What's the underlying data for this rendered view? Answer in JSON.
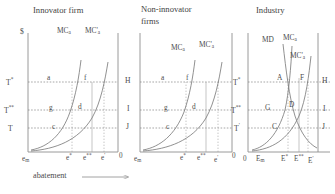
{
  "figure": {
    "axis_value_label": "$",
    "bottom_axis_label": "abatement",
    "panels": [
      {
        "id": "innovator",
        "title": "Innovator firm",
        "curves": [
          {
            "name": "MCa",
            "label_main": "MC",
            "label_sub": "a"
          },
          {
            "name": "MC'a",
            "label_main": "MC'",
            "label_sub": "a"
          }
        ],
        "y_labels": [
          {
            "main": "T",
            "sup": "*"
          },
          {
            "main": "T",
            "sup": "**"
          },
          {
            "main": "T",
            "sup": ""
          }
        ],
        "points": [
          "a",
          "f",
          "g",
          "d",
          "c"
        ],
        "x_labels": [
          {
            "main": "e",
            "sub": "m",
            "sup": ""
          },
          {
            "main": "e",
            "sub": "",
            "sup": "*"
          },
          {
            "main": "e",
            "sub": "",
            "sup": "**"
          },
          {
            "main": "e",
            "sub": "",
            "sup": "'"
          },
          {
            "main": "0",
            "sub": "",
            "sup": ""
          }
        ]
      },
      {
        "id": "non-innovator",
        "title": "Non-innovator firms",
        "title_line1": "Non-innovator",
        "title_line2": "firms",
        "curves": [
          {
            "name": "MCa",
            "label_main": "MC",
            "label_sub": "a"
          },
          {
            "name": "MC'a",
            "label_main": "MC'",
            "label_sub": "a"
          }
        ],
        "y_labels": [
          {
            "main": "H",
            "sup": ""
          },
          {
            "main": "I",
            "sup": ""
          },
          {
            "main": "J",
            "sup": ""
          }
        ],
        "points": [
          "a",
          "f",
          "g",
          "d",
          "c"
        ],
        "x_labels": [
          {
            "main": "e",
            "sub": "m",
            "sup": ""
          },
          {
            "main": "e",
            "sub": "",
            "sup": "*"
          },
          {
            "main": "e",
            "sub": "",
            "sup": "**"
          },
          {
            "main": "e",
            "sub": "",
            "sup": "'"
          },
          {
            "main": "0",
            "sub": "",
            "sup": ""
          }
        ]
      },
      {
        "id": "industry",
        "title": "Industry",
        "curves": [
          {
            "name": "MD",
            "label_main": "MD",
            "label_sub": ""
          },
          {
            "name": "MCa",
            "label_main": "MC",
            "label_sub": "a"
          },
          {
            "name": "MC'a",
            "label_main": "MC'",
            "label_sub": "a"
          }
        ],
        "y_labels_left": [
          {
            "main": "T",
            "sup": "*"
          },
          {
            "main": "T",
            "sup": "**"
          },
          {
            "main": "T",
            "sup": "'"
          }
        ],
        "y_labels_right": [
          {
            "main": "H",
            "sup": ""
          },
          {
            "main": "I",
            "sup": ""
          },
          {
            "main": "J",
            "sup": ""
          }
        ],
        "points": [
          "A",
          "F",
          "G",
          "D",
          "C"
        ],
        "x_labels": [
          {
            "main": "E",
            "sub": "m",
            "sup": ""
          },
          {
            "main": "E",
            "sub": "",
            "sup": "*"
          },
          {
            "main": "E",
            "sub": "",
            "sup": "**"
          },
          {
            "main": "E",
            "sub": "",
            "sup": "'"
          }
        ]
      }
    ],
    "colors": {
      "ink": "#4d4d4d",
      "line": "#707070",
      "dashed": "#8a8a8a",
      "background": "#ffffff"
    }
  }
}
